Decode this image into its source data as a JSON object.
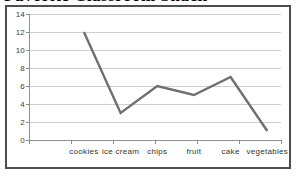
{
  "page": {
    "background": "#ffffff"
  },
  "chart_data": {
    "type": "line",
    "title": "Favorite Classroom Snack",
    "title_partially_cropped_at_top": true,
    "categories": [
      "cookies",
      "ice cream",
      "chips",
      "fruit",
      "cake",
      "vegetables"
    ],
    "values": [
      12,
      3,
      6,
      5,
      7,
      1
    ],
    "xlabel": "",
    "ylabel": "",
    "ylim": [
      0,
      14
    ],
    "yticks": [
      0,
      2,
      4,
      6,
      8,
      10,
      12,
      14
    ],
    "grid": "horizontal",
    "legend": "none",
    "markers": "none",
    "line_color": "#6f6f6f",
    "grid_color": "#cfcfcf",
    "axis_color": "#919191",
    "tick_color": "#8c8c8c",
    "label_color": "#3a3a3a",
    "frame_border_color": "#4d4d4d"
  }
}
